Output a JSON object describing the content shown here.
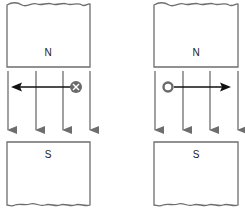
{
  "diagrams": [
    {
      "id": "left",
      "top_magnet": {
        "label": "N"
      },
      "bottom_magnet": {
        "label": "S"
      },
      "current_symbol": "cross",
      "current_meaning": "into page",
      "force_direction": "left"
    },
    {
      "id": "right",
      "top_magnet": {
        "label": "N"
      },
      "bottom_magnet": {
        "label": "S"
      },
      "current_symbol": "dot",
      "current_meaning": "out of page",
      "force_direction": "right"
    }
  ],
  "field_lines_per_diagram": 4,
  "field_direction": "down (N to S)",
  "colors": {
    "magnet_outline": "#6e6e6e",
    "field_line": "#6e6e6e",
    "force_arrow": "#111111",
    "current_marker": "#6a6a6a"
  }
}
